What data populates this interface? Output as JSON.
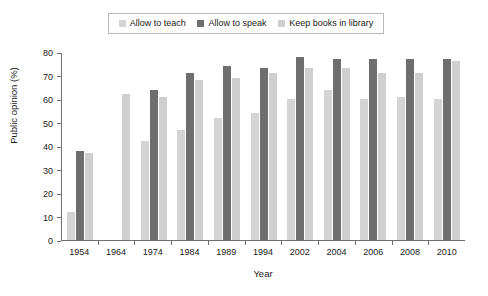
{
  "chart_data": {
    "type": "bar",
    "title": "",
    "xlabel": "Year",
    "ylabel": "Public opinion (%)",
    "ylim": [
      0,
      80
    ],
    "yticks": [
      0,
      10,
      20,
      30,
      40,
      50,
      60,
      70,
      80
    ],
    "grid": false,
    "legend_position": "top-center",
    "categories": [
      "1954",
      "1964",
      "1974",
      "1984",
      "1989",
      "1994",
      "2002",
      "2004",
      "2006",
      "2008",
      "2010"
    ],
    "series": [
      {
        "name": "Allow to teach",
        "color": "#d4d4d4",
        "values": [
          12,
          null,
          42,
          47,
          52,
          54,
          60,
          64,
          60,
          61,
          60
        ]
      },
      {
        "name": "Allow to speak",
        "color": "#6e6e6e",
        "values": [
          38,
          null,
          64,
          71,
          74,
          73,
          78,
          77,
          77,
          77,
          77
        ]
      },
      {
        "name": "Keep books in library",
        "color": "#cfcfcf",
        "values": [
          37,
          62,
          61,
          68,
          69,
          71,
          73,
          73,
          71,
          71,
          76
        ]
      }
    ]
  },
  "legend": {
    "items": [
      {
        "label": "Allow to teach",
        "color": "#d4d4d4"
      },
      {
        "label": "Allow to speak",
        "color": "#6e6e6e"
      },
      {
        "label": "Keep books in library",
        "color": "#cfcfcf"
      }
    ]
  },
  "axis": {
    "y_title": "Public opinion (%)",
    "x_title": "Year"
  }
}
